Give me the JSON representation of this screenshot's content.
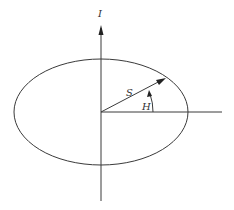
{
  "diagram": {
    "labels": {
      "vertical_axis": "I",
      "vector": "S",
      "angle": "H"
    },
    "colors": {
      "stroke": "#3a3a3a",
      "background": "#ffffff"
    }
  }
}
